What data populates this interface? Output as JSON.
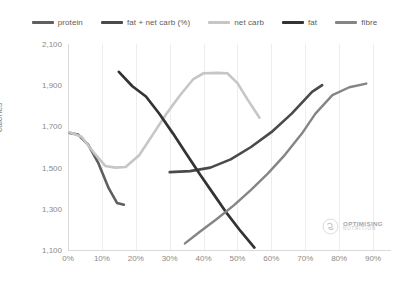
{
  "chart_data": {
    "type": "line",
    "title": "",
    "xlabel": "",
    "ylabel": "calories",
    "xlim": [
      0,
      95
    ],
    "ylim": [
      1100,
      2100
    ],
    "grid": true,
    "legend_position": "top",
    "x_tick_labels": [
      "0%",
      "10%",
      "20%",
      "30%",
      "40%",
      "50%",
      "60%",
      "70%",
      "80%",
      "90%"
    ],
    "x_tick_values": [
      0,
      10,
      20,
      30,
      40,
      50,
      60,
      70,
      80,
      90
    ],
    "y_tick_labels": [
      "2,100",
      "1,900",
      "1,700",
      "1,500",
      "1,300",
      "1,100"
    ],
    "y_tick_values": [
      2100,
      1900,
      1700,
      1500,
      1300,
      1100
    ],
    "series": [
      {
        "name": "protein",
        "color": "#5f5f5f",
        "x": [
          0.5,
          3,
          6,
          9,
          12,
          14.5,
          16.5
        ],
        "values": [
          1668,
          1660,
          1610,
          1520,
          1400,
          1328,
          1320
        ]
      },
      {
        "name": "fat + net carb (%)",
        "color": "#4a4a4a",
        "x": [
          30,
          36,
          42,
          48,
          54,
          60,
          66,
          72,
          75
        ],
        "values": [
          1478,
          1483,
          1500,
          1540,
          1600,
          1672,
          1762,
          1868,
          1900
        ]
      },
      {
        "name": "net carb",
        "color": "#c6c6c6",
        "x": [
          0.5,
          4,
          8,
          11,
          14,
          17,
          21,
          25,
          29,
          33,
          37,
          40,
          44,
          47,
          50,
          53,
          56.5
        ],
        "values": [
          1672,
          1650,
          1565,
          1508,
          1500,
          1503,
          1560,
          1660,
          1760,
          1850,
          1930,
          1958,
          1960,
          1958,
          1910,
          1830,
          1742
        ]
      },
      {
        "name": "fat",
        "color": "#333333",
        "x": [
          15,
          19,
          23,
          27,
          31,
          35,
          39,
          43,
          47,
          51,
          55
        ],
        "values": [
          1965,
          1895,
          1845,
          1760,
          1665,
          1565,
          1465,
          1370,
          1275,
          1190,
          1112
        ]
      },
      {
        "name": "fibre",
        "color": "#858585",
        "x": [
          34.5,
          39,
          44,
          49,
          54,
          59,
          64,
          69,
          73,
          78,
          83,
          88
        ],
        "values": [
          1132,
          1190,
          1252,
          1318,
          1392,
          1472,
          1562,
          1665,
          1762,
          1852,
          1890,
          1908
        ]
      }
    ]
  },
  "legend": {
    "items": [
      {
        "label": "protein",
        "color": "#5f5f5f"
      },
      {
        "label": "fat + net carb (%)",
        "color": "#4a4a4a"
      },
      {
        "label": "net carb",
        "color": "#c6c6c6"
      },
      {
        "label": "fat",
        "color": "#333333"
      },
      {
        "label": "fibre",
        "color": "#858585"
      }
    ]
  },
  "axes": {
    "y_title": "calories"
  },
  "watermark": {
    "line1": "OPTIMISING",
    "line2": "NUTRITION"
  }
}
